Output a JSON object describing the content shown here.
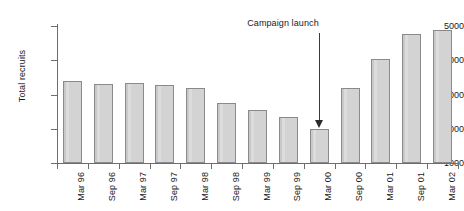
{
  "chart_data": {
    "type": "bar",
    "title": "",
    "xlabel": "",
    "ylabel": "Total recruits",
    "ylim": [
      1000,
      5000
    ],
    "yticks": [
      1000,
      2000,
      3000,
      4000,
      5000
    ],
    "ytick_labels": [
      "1000",
      "2000",
      "3000",
      "4000",
      "5000"
    ],
    "grid": false,
    "legend": "none",
    "categories": [
      "Mar 96",
      "Sep 96",
      "Mar 97",
      "Sep 97",
      "Mar 98",
      "Sep 98",
      "Mar 99",
      "Sep 99",
      "Mar 00",
      "Sep 00",
      "Mar 01",
      "Sep 01",
      "Mar 02"
    ],
    "values": [
      3400,
      3300,
      3350,
      3280,
      3200,
      2750,
      2550,
      2350,
      1980,
      3180,
      4050,
      4780,
      4880
    ],
    "annotations": [
      {
        "text": "Campaign launch",
        "points_to_category": "Mar 00",
        "arrow": "down"
      }
    ],
    "bar_fill_color": "#d3d3d3",
    "bar_edge_color": "#8a8a8a",
    "axis_color": "#6d6d6d",
    "text_color": "#1a1a1a"
  }
}
